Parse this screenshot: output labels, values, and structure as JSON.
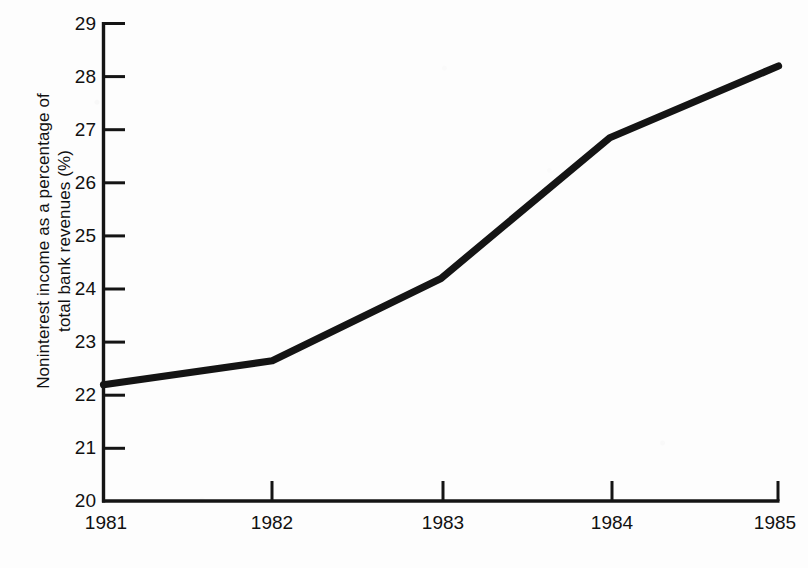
{
  "chart_data": {
    "type": "line",
    "title": "",
    "xlabel": "",
    "ylabel": "Noninterest income as a percentage of total bank revenues (%)",
    "ylabel_lines": [
      "Noninterest income as a percentage of",
      "total bank revenues (%)"
    ],
    "categories": [
      "1981",
      "1982",
      "1983",
      "1984",
      "1985"
    ],
    "x": [
      1981,
      1982,
      1983,
      1984,
      1985
    ],
    "values": [
      22.2,
      22.65,
      24.2,
      26.85,
      28.2
    ],
    "series": [
      {
        "name": "Noninterest income share of total bank revenues",
        "values": [
          22.2,
          22.65,
          24.2,
          26.85,
          28.2
        ]
      }
    ],
    "xlim": [
      1981,
      1985
    ],
    "ylim": [
      20,
      29
    ],
    "ytick_labels": [
      "29",
      "28",
      "27",
      "26",
      "25",
      "24",
      "23",
      "22",
      "21",
      "20"
    ],
    "ytick_values": [
      29,
      28,
      27,
      26,
      25,
      24,
      23,
      22,
      21,
      20
    ],
    "xtick_labels": [
      "1981",
      "1982",
      "1983",
      "1984",
      "1985"
    ],
    "grid": false,
    "legend": false,
    "line_color": "#141414",
    "axis_color": "#141414",
    "background_color": "#fdfdfd"
  }
}
